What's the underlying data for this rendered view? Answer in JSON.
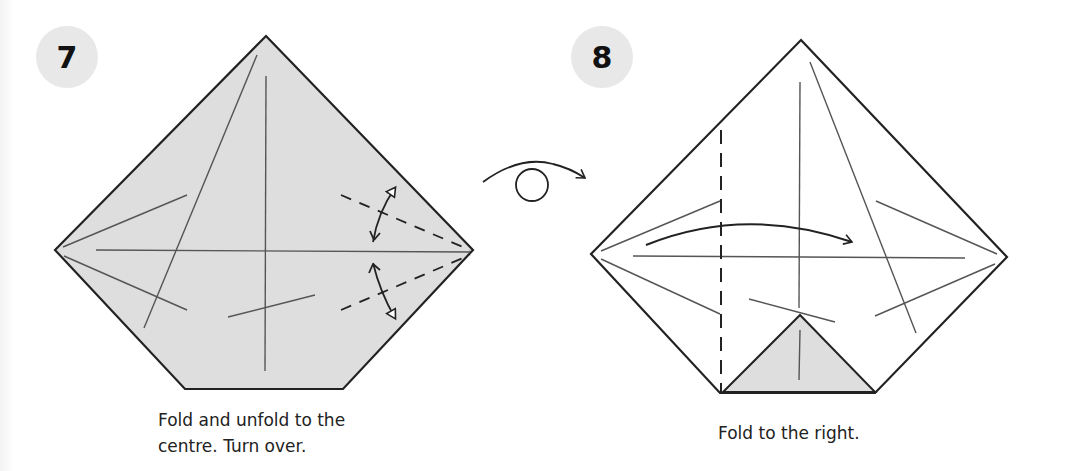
{
  "steps": [
    {
      "number": "7",
      "caption_line1": "Fold and unfold to the",
      "caption_line2": "centre. Turn over."
    },
    {
      "number": "8",
      "caption_line1": "Fold to the right."
    }
  ],
  "icons": {
    "turn_over": "turn-over-arrow",
    "fold_unfold": "double-headed-arrow",
    "fold_direction": "curved-arrow-right"
  },
  "colors": {
    "paper_shaded": "#dedede",
    "paper_white": "#ffffff",
    "line": "#222222",
    "crease": "#555555",
    "badge": "#e8e8e8"
  }
}
